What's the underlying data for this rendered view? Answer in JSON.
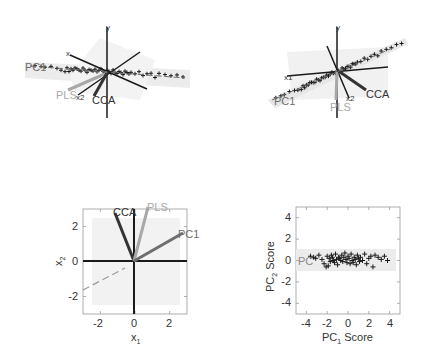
{
  "colors": {
    "axis": "#1a1a1a",
    "cca": "#333333",
    "pls": "#a8a8a8",
    "pc1": "#6e6e6e",
    "plane": "#ececec",
    "points": "#1a1a1a",
    "text": "#333333"
  },
  "panels": {
    "top_left": {
      "type": "3d-scatter",
      "labels": {
        "y": "y",
        "x1": "x",
        "pc1": "PC1",
        "pls": "PLS",
        "x2": "x2",
        "cca": "CCA"
      }
    },
    "top_right": {
      "type": "3d-scatter",
      "labels": {
        "y": "y",
        "x1": "x1",
        "pc1": "PC1",
        "pls": "PLS",
        "x2": "x2",
        "cca": "CCA"
      }
    },
    "bottom_left": {
      "xlabel": "x",
      "xlabel_sub": "1",
      "ylabel": "x",
      "ylabel_sub": "2",
      "xticks": [
        "-2",
        "0",
        "2"
      ],
      "yticks": [
        "2",
        "0",
        "-2"
      ],
      "vectors": {
        "cca": "CCA",
        "pls": "PLS",
        "pc1": "PC1"
      }
    },
    "bottom_right": {
      "xlabel": "PC",
      "xlabel_sub": "1",
      "xlabel_suffix": " Score",
      "ylabel": "PC",
      "ylabel_sub": "2",
      "ylabel_suffix": " Score",
      "xticks": [
        "-4",
        "-2",
        "0",
        "2",
        "4"
      ],
      "yticks": [
        "4",
        "2",
        "0",
        "-2",
        "-4"
      ],
      "inset_label": "PC"
    }
  },
  "chart_data": [
    {
      "type": "scatter",
      "title": "",
      "subtype": "3d",
      "xlabel": "x1",
      "ylabel": "y",
      "zlabel": "x2",
      "annotations": [
        "y",
        "x",
        "PC1",
        "PLS",
        "x2",
        "CCA"
      ],
      "note": "3D view of data cloud on shaded plane with PC1, PLS and CCA direction vectors"
    },
    {
      "type": "scatter",
      "title": "",
      "subtype": "3d",
      "xlabel": "x1",
      "ylabel": "y",
      "zlabel": "x2",
      "annotations": [
        "y",
        "x1",
        "PC1",
        "PLS",
        "x2",
        "CCA"
      ],
      "note": "Rotated 3D view of the same data cloud and direction vectors"
    },
    {
      "type": "line",
      "title": "",
      "xlabel": "x1",
      "ylabel": "x2",
      "xlim": [
        -3,
        3
      ],
      "ylim": [
        -3,
        3
      ],
      "xticks": [
        -2,
        0,
        2
      ],
      "yticks": [
        -2,
        0,
        2
      ],
      "grid": false,
      "series": [
        {
          "name": "CCA",
          "x": [
            0,
            -0.85
          ],
          "y": [
            0,
            2.75
          ]
        },
        {
          "name": "PLS",
          "x": [
            0,
            0.8
          ],
          "y": [
            0,
            3.1
          ]
        },
        {
          "name": "PC1",
          "x": [
            0,
            2.8
          ],
          "y": [
            0,
            1.6
          ]
        },
        {
          "name": "dashed",
          "x": [
            -3,
            -0.5
          ],
          "y": [
            -1.7,
            -0.45
          ],
          "style": "dashed"
        }
      ],
      "shaded_region": {
        "x": [
          -2.5,
          2.5
        ],
        "y": [
          -2.5,
          2.5
        ]
      }
    },
    {
      "type": "scatter",
      "title": "",
      "xlabel": "PC1 Score",
      "ylabel": "PC2 Score",
      "xlim": [
        -5,
        5
      ],
      "ylim": [
        -5,
        5
      ],
      "xticks": [
        -4,
        -2,
        0,
        2,
        4
      ],
      "yticks": [
        -4,
        -2,
        0,
        2,
        4
      ],
      "grid": false,
      "shaded_region": {
        "x": [
          -5,
          4.5
        ],
        "y": [
          -1,
          1.1
        ]
      },
      "marker": "+",
      "x": [
        -3.6,
        -3.3,
        -3.1,
        -2.8,
        -2.5,
        -2.3,
        -2.1,
        -2.0,
        -1.9,
        -1.8,
        -1.7,
        -1.6,
        -1.5,
        -1.4,
        -1.3,
        -1.2,
        -1.1,
        -1.0,
        -0.9,
        -0.8,
        -0.7,
        -0.6,
        -0.5,
        -0.4,
        -0.3,
        -0.2,
        -0.1,
        0.0,
        0.1,
        0.2,
        0.3,
        0.4,
        0.5,
        0.6,
        0.7,
        0.8,
        0.9,
        1.0,
        1.1,
        1.2,
        1.4,
        1.6,
        1.8,
        2.0,
        2.2,
        2.4,
        2.6,
        2.9,
        3.2,
        3.5,
        3.8
      ],
      "y": [
        0.4,
        0.3,
        0.2,
        0.5,
        0.1,
        -0.3,
        -0.6,
        0.4,
        -0.5,
        0.2,
        -0.1,
        0.5,
        0.3,
        0.0,
        -0.2,
        0.6,
        0.1,
        -0.4,
        0.3,
        0.2,
        0.0,
        0.5,
        -0.1,
        0.3,
        0.7,
        0.1,
        -0.2,
        0.4,
        0.2,
        -0.3,
        0.6,
        0.0,
        -0.2,
        0.3,
        0.1,
        -0.4,
        0.5,
        0.2,
        -0.1,
        0.3,
        0.0,
        0.6,
        -0.3,
        0.2,
        0.4,
        -0.6,
        0.5,
        0.3,
        0.1,
        0.4,
        0.0
      ]
    }
  ]
}
